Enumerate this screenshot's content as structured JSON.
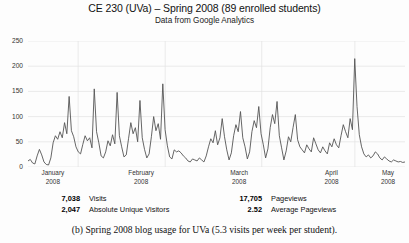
{
  "chart_data": {
    "type": "line",
    "title": "CE 230 (UVa) – Spring 2008 (89 enrolled students)",
    "subtitle": "Data from Google Analytics",
    "xlabel": "",
    "ylabel": "",
    "ylim": [
      0,
      250
    ],
    "yticks": [
      0,
      50,
      100,
      150,
      200,
      250
    ],
    "ytick_labels": [
      "0",
      "50",
      "100",
      "150",
      "200",
      "250"
    ],
    "grid": true,
    "legend": "none",
    "series_name": "Visits",
    "line_color": "#555555",
    "grid_color": "#e3e3e3",
    "xtick_labels": [
      {
        "month": "January",
        "year": "2008",
        "pos_pct": 6.6
      },
      {
        "month": "February",
        "year": "2008",
        "pos_pct": 30.0
      },
      {
        "month": "March",
        "year": "2008",
        "pos_pct": 56.0
      },
      {
        "month": "April",
        "year": "2008",
        "pos_pct": 80.5
      },
      {
        "month": "May",
        "year": "2008",
        "pos_pct": 95.5
      }
    ],
    "month_boundaries_pct": [
      13.3,
      36.4,
      62.0,
      86.7
    ],
    "values": [
      12,
      15,
      8,
      6,
      22,
      35,
      24,
      10,
      5,
      4,
      18,
      48,
      62,
      55,
      70,
      58,
      88,
      66,
      140,
      72,
      60,
      40,
      30,
      26,
      45,
      62,
      52,
      58,
      38,
      155,
      70,
      48,
      22,
      18,
      30,
      52,
      42,
      64,
      46,
      148,
      62,
      40,
      20,
      24,
      56,
      88,
      66,
      78,
      50,
      132,
      58,
      35,
      18,
      26,
      60,
      100,
      72,
      86,
      55,
      165,
      74,
      42,
      20,
      16,
      34,
      30,
      32,
      28,
      22,
      18,
      12,
      10,
      16,
      14,
      12,
      18,
      14,
      10,
      22,
      40,
      56,
      48,
      72,
      44,
      58,
      96,
      60,
      34,
      14,
      28,
      62,
      84,
      70,
      110,
      58,
      40,
      16,
      30,
      70,
      92,
      78,
      120,
      66,
      44,
      18,
      36,
      78,
      104,
      86,
      130,
      62,
      38,
      14,
      32,
      60,
      50,
      78,
      104,
      54,
      40,
      34,
      28,
      44,
      36,
      30,
      58,
      46,
      34,
      28,
      40,
      32,
      26,
      48,
      40,
      56,
      44,
      38,
      62,
      84,
      70,
      58,
      96,
      74,
      215,
      120,
      64,
      40,
      26,
      20,
      24,
      18,
      22,
      30,
      26,
      18,
      14,
      20,
      16,
      12,
      10,
      14,
      12,
      10,
      11,
      9,
      10
    ]
  },
  "stats": {
    "items": [
      {
        "value": "7,038",
        "label": "Visits"
      },
      {
        "value": "2,047",
        "label": "Absolute Unique Visitors"
      },
      {
        "value": "17,705",
        "label": "Pageviews"
      },
      {
        "value": "2.52",
        "label": "Average Pageviews"
      }
    ]
  },
  "caption": {
    "text": "(b)  Spring 2008 blog usage for UVa (5.3 visits per week per student)."
  }
}
